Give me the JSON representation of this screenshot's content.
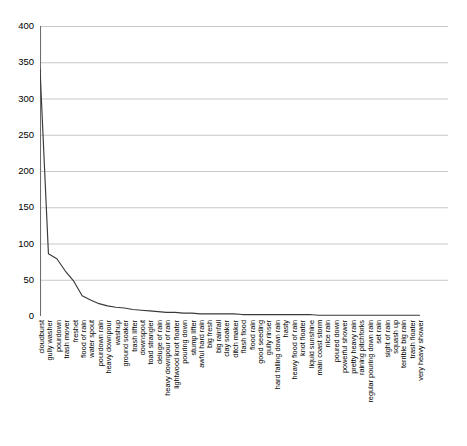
{
  "chart_data": {
    "type": "line",
    "title": "",
    "subtitle": "",
    "xlabel": "",
    "ylabel": "",
    "ylim": [
      0,
      400
    ],
    "yticks": [
      0,
      50,
      100,
      150,
      200,
      250,
      300,
      350,
      400
    ],
    "grid": true,
    "grid_axis": "y",
    "legend": false,
    "legend_position": "none",
    "line_color": "#3a3a3a",
    "grid_color": "#c8c8c8",
    "axis_color": "#808080",
    "background": "#ffffff",
    "categories": [
      "cloudburst",
      "gully washer",
      "pourdown",
      "trash mover",
      "freshet",
      "flood of rain",
      "water spout",
      "pourdown rain",
      "heavy downpour",
      "washup",
      "ground soaker",
      "trash lifter",
      "downspout",
      "toad strangler",
      "deluge of rain",
      "heavy downpour of rain",
      "lightwood knot floater",
      "pouring down",
      "stump lifter",
      "awful hard rain",
      "big fresh",
      "big rainfall",
      "clay soaker",
      "ditch maker",
      "flash flood",
      "flood rain",
      "good seeding",
      "gully rinser",
      "hard falling down rain",
      "hasty",
      "heavy flood of rain",
      "knot floater",
      "liquid sunshine",
      "main coast storm",
      "nice rain",
      "poured down",
      "powerful shower",
      "pretty heavy rain",
      "raining pitchforks",
      "regular pouring down rain",
      "set rain",
      "sight of rain",
      "squash up",
      "terrible big rain",
      "trash floater",
      "very heavy shower"
    ],
    "values": [
      341,
      86,
      79,
      62,
      48,
      28,
      22,
      17,
      14,
      12,
      11,
      9,
      8,
      7,
      6,
      5,
      5,
      4,
      4,
      3,
      3,
      3,
      3,
      3,
      2,
      2,
      2,
      2,
      2,
      2,
      2,
      2,
      2,
      1,
      1,
      1,
      1,
      1,
      1,
      1,
      1,
      1,
      1,
      1,
      1,
      1
    ],
    "series": [
      {
        "name": "frequency",
        "values": [
          341,
          86,
          79,
          62,
          48,
          28,
          22,
          17,
          14,
          12,
          11,
          9,
          8,
          7,
          6,
          5,
          5,
          4,
          4,
          3,
          3,
          3,
          3,
          3,
          2,
          2,
          2,
          2,
          2,
          2,
          2,
          2,
          2,
          1,
          1,
          1,
          1,
          1,
          1,
          1,
          1,
          1,
          1,
          1,
          1,
          1
        ]
      }
    ],
    "n_xticks": 92
  }
}
